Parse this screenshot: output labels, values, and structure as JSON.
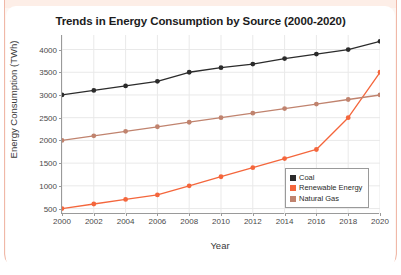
{
  "chart_data": {
    "type": "line",
    "title": "Trends in Energy Consumption by Source (2000-2020)",
    "xlabel": "Year",
    "ylabel": "Energy Consumption (TWh)",
    "x": [
      2000,
      2002,
      2004,
      2006,
      2008,
      2010,
      2012,
      2014,
      2016,
      2018,
      2020
    ],
    "xtick_labels": [
      "2000",
      "2002",
      "2004",
      "2006",
      "2008",
      "2010",
      "2012",
      "2014",
      "2016",
      "2018",
      "2020"
    ],
    "ytick_labels": [
      "500",
      "1000",
      "1500",
      "2000",
      "2500",
      "3000",
      "3500",
      "4000"
    ],
    "yticks": [
      500,
      1000,
      1500,
      2000,
      2500,
      3000,
      3500,
      4000
    ],
    "xlim": [
      2000,
      2020
    ],
    "ylim": [
      380,
      4320
    ],
    "grid": true,
    "legend_position": "lower right",
    "series": [
      {
        "name": "Coal",
        "color": "#2b2b2b",
        "values": [
          3000,
          3100,
          3200,
          3300,
          3500,
          3600,
          3680,
          3800,
          3900,
          4000,
          4180
        ]
      },
      {
        "name": "Renewable Energy",
        "color": "#f4663c",
        "values": [
          500,
          600,
          700,
          800,
          1000,
          1200,
          1400,
          1600,
          1800,
          2500,
          3500
        ]
      },
      {
        "name": "Natural Gas",
        "color": "#c0836e",
        "values": [
          2000,
          2100,
          2200,
          2300,
          2400,
          2500,
          2600,
          2700,
          2800,
          2900,
          3000
        ]
      }
    ]
  },
  "frame": {
    "border_color": "#f0b8a8",
    "band_color": "#fdeee7"
  }
}
